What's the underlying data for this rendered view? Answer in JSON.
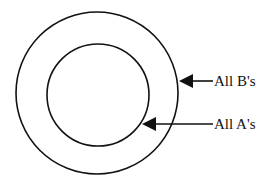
{
  "diagram": {
    "type": "concentric-sets",
    "outer_set": {
      "label": "All B's"
    },
    "inner_set": {
      "label": "All A's"
    },
    "colors": {
      "stroke": "#111111",
      "background": "#ffffff"
    }
  }
}
